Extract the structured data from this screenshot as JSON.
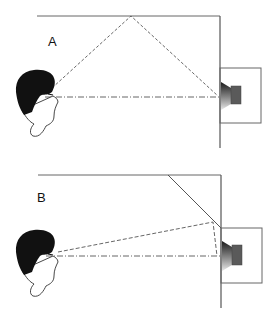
{
  "diagram": {
    "panels": [
      {
        "id": "A",
        "label": "A",
        "description": "Listener with sound reflecting off flat ceiling from wall-mounted speaker",
        "reflection_type": "ceiling reflection"
      },
      {
        "id": "B",
        "label": "B",
        "description": "Listener with angled deflector redirecting speaker reflection",
        "reflection_type": "angled deflector"
      }
    ],
    "colors": {
      "line": "#555555",
      "hair": "#111111",
      "speaker_dark": "#333333",
      "magnet": "#5a5a5a",
      "background": "#ffffff"
    },
    "legend": {
      "direct_path": "dash-dot line",
      "reflected_path": "dashed line"
    }
  }
}
